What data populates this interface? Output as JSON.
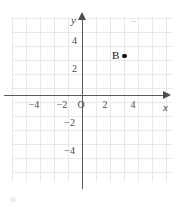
{
  "figure": {
    "type": "coordinate-plane",
    "background_color": "#ffffff",
    "grid_color": "#e7e7ee",
    "axis_color": "#5a5a5a",
    "point_color": "#111111"
  },
  "axes": {
    "x_name": "x",
    "y_name": "y",
    "origin_label": "O",
    "x_ticks": [
      "−4",
      "−2",
      "2",
      "4"
    ],
    "y_ticks": [
      "4",
      "2",
      "−2",
      "−4"
    ],
    "x_range": [
      -5,
      6
    ],
    "y_range": [
      -6,
      5
    ],
    "grid": true
  },
  "points": [
    {
      "label": "B",
      "x": 3,
      "y": 3,
      "marker": "filled-dot"
    }
  ],
  "chart_data": {
    "type": "scatter",
    "title": "",
    "xlabel": "x",
    "ylabel": "y",
    "xlim": [
      -5,
      6
    ],
    "ylim": [
      -6,
      5
    ],
    "grid": true,
    "legend": "none",
    "xticks": [
      -4,
      -2,
      2,
      4
    ],
    "xticklabels": [
      "−4",
      "−2",
      "2",
      "4"
    ],
    "yticks": [
      4,
      2,
      -2,
      -4
    ],
    "yticklabels": [
      "4",
      "2",
      "−2",
      "−4"
    ],
    "origin_label": "O",
    "series": [
      {
        "name": "B",
        "x": [
          3
        ],
        "y": [
          3
        ],
        "labels": [
          "B"
        ],
        "marker": "o",
        "color": "#111111"
      }
    ],
    "annotations": [
      {
        "text": "B",
        "x": 3,
        "y": 3,
        "position": "left-of-point"
      }
    ]
  }
}
